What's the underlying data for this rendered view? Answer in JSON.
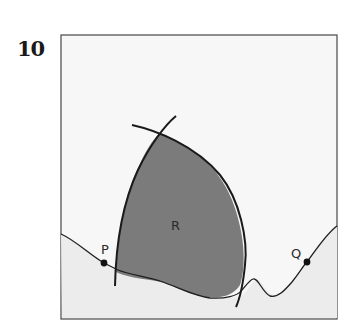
{
  "problem": {
    "number": "10"
  },
  "diagram": {
    "labels": {
      "region": "R",
      "point_p": "P",
      "point_q": "Q"
    },
    "colors": {
      "frame": "#555555",
      "background": "#f6f6f6",
      "lower_fill": "#ececec",
      "region_fill": "#7a7a7a",
      "curve": "#1e1e1e",
      "point": "#111111"
    }
  }
}
